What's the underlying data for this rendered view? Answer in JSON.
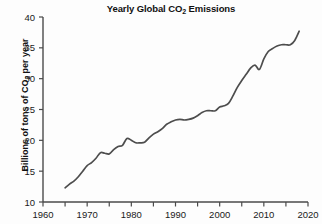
{
  "chart_data": {
    "type": "line",
    "title": "Yearly Global CO2 Emissions",
    "title_parts": {
      "pre": "Yearly Global CO",
      "sub": "2",
      "post": " Emissions"
    },
    "xlabel": "",
    "ylabel": "Billions of tons of CO2 per year",
    "ylabel_parts": {
      "pre": "Billions of tons of CO",
      "sub": "2",
      "post": " per year"
    },
    "xlim": [
      1960,
      2020
    ],
    "ylim": [
      10,
      40
    ],
    "xticks": [
      1960,
      1970,
      1980,
      1990,
      2000,
      2010,
      2020
    ],
    "xtick_labels": [
      "1960",
      "1970",
      "1980",
      "1990",
      "2000",
      "2010",
      "2020"
    ],
    "xminor_ticks": [
      1965,
      1975,
      1985,
      1995,
      2005,
      2015
    ],
    "yticks": [
      10,
      15,
      20,
      25,
      30,
      35,
      40
    ],
    "ytick_labels": [
      "10",
      "15",
      "20",
      "25",
      "30",
      "35",
      "40"
    ],
    "grid": false,
    "legend": false,
    "line_color": "#4d4d4d",
    "series": [
      {
        "name": "Global CO2 emissions",
        "x": [
          1965,
          1966,
          1967,
          1968,
          1969,
          1970,
          1971,
          1972,
          1973,
          1974,
          1975,
          1976,
          1977,
          1978,
          1979,
          1980,
          1981,
          1982,
          1983,
          1984,
          1985,
          1986,
          1987,
          1988,
          1989,
          1990,
          1991,
          1992,
          1993,
          1994,
          1995,
          1996,
          1997,
          1998,
          1999,
          2000,
          2001,
          2002,
          2003,
          2004,
          2005,
          2006,
          2007,
          2008,
          2009,
          2010,
          2011,
          2012,
          2013,
          2014,
          2015,
          2016,
          2017,
          2018
        ],
        "values": [
          12.3,
          12.9,
          13.4,
          14.1,
          15.0,
          15.9,
          16.4,
          17.1,
          18.0,
          17.9,
          17.8,
          18.5,
          19.0,
          19.2,
          20.3,
          20.0,
          19.6,
          19.6,
          19.7,
          20.4,
          21.0,
          21.4,
          21.9,
          22.6,
          23.0,
          23.3,
          23.4,
          23.3,
          23.4,
          23.6,
          24.0,
          24.5,
          24.8,
          24.8,
          24.8,
          25.4,
          25.6,
          26.0,
          27.2,
          28.6,
          29.7,
          30.7,
          31.7,
          32.2,
          31.5,
          33.2,
          34.4,
          34.9,
          35.3,
          35.5,
          35.5,
          35.5,
          36.2,
          37.7
        ],
        "units": "billions of tons per year"
      }
    ]
  }
}
